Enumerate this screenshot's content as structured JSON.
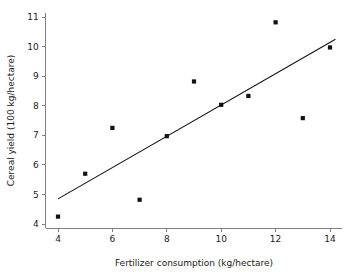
{
  "chart_data": {
    "type": "scatter",
    "title": "",
    "subtitle": "",
    "xlabel": "Fertilizer consumption (kg/hectare)",
    "ylabel": "Cereal yield (100 kg/hectare)",
    "xlim": [
      3.55,
      14.45
    ],
    "ylim": [
      3.85,
      11.15
    ],
    "xticks": [
      4,
      6,
      8,
      10,
      12,
      14
    ],
    "xtick_labels": [
      "4",
      "6",
      "8",
      "10",
      "12",
      "14"
    ],
    "yticks": [
      4,
      5,
      6,
      7,
      8,
      9,
      10,
      11
    ],
    "ytick_labels": [
      "4",
      "5",
      "6",
      "7",
      "8",
      "9",
      "10",
      "11"
    ],
    "grid": false,
    "legend": false,
    "legend_position": "none",
    "marker_color": "#111111",
    "line_color": "#111111",
    "axis_color": "#808080",
    "background_color": "#ffffff",
    "x": [
      4,
      5,
      6,
      7,
      8,
      9,
      10,
      11,
      12,
      13,
      14
    ],
    "y": [
      4.25,
      5.7,
      7.25,
      4.82,
      6.97,
      8.82,
      8.03,
      8.33,
      10.82,
      7.58,
      9.97
    ],
    "points": [
      {
        "x": 4,
        "y": 4.25
      },
      {
        "x": 5,
        "y": 5.7
      },
      {
        "x": 6,
        "y": 7.25
      },
      {
        "x": 7,
        "y": 4.82
      },
      {
        "x": 8,
        "y": 6.97
      },
      {
        "x": 9,
        "y": 8.82
      },
      {
        "x": 10,
        "y": 8.03
      },
      {
        "x": 11,
        "y": 8.33
      },
      {
        "x": 12,
        "y": 10.82
      },
      {
        "x": 13,
        "y": 7.58
      },
      {
        "x": 14,
        "y": 9.97
      }
    ],
    "trend_line": {
      "name": "fitted regression line",
      "x_start": 4.0,
      "y_start": 4.85,
      "x_end": 14.2,
      "y_end": 10.25
    }
  }
}
